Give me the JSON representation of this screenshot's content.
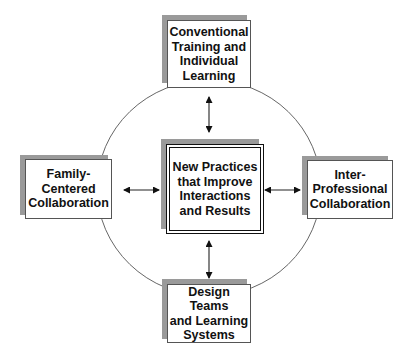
{
  "diagram": {
    "center": {
      "label": "New Practices\nthat Improve\nInteractions\nand Results"
    },
    "top": {
      "label": "Conventional\nTraining and\nIndividual\nLearning"
    },
    "left": {
      "label": "Family-\nCentered\nCollaboration"
    },
    "right": {
      "label": "Inter-\nProfessional\nCollaboration"
    },
    "bottom": {
      "label": "Design Teams\nand Learning\nSystems"
    },
    "connectors": [
      {
        "from": "top",
        "to": "center",
        "type": "bidirectional-arrow"
      },
      {
        "from": "left",
        "to": "center",
        "type": "bidirectional-arrow"
      },
      {
        "from": "right",
        "to": "center",
        "type": "bidirectional-arrow"
      },
      {
        "from": "bottom",
        "to": "center",
        "type": "bidirectional-arrow"
      }
    ],
    "colors": {
      "line": "#333333",
      "shadow": "#9a9a9a",
      "box_border": "#555555",
      "center_border": "#111111"
    }
  }
}
